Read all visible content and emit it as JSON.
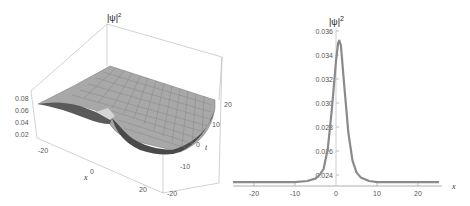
{
  "chart_data": [
    {
      "type": "surface3d",
      "title": "",
      "zlabel": "|ψ|²",
      "xlabel": "x",
      "ylabel": "t",
      "x_ticks": [
        "-20",
        "0",
        "20"
      ],
      "t_ticks": [
        "20",
        "10",
        "0",
        "-10",
        "-20"
      ],
      "z_ticks": [
        "0.08",
        "0.06",
        "0.04",
        "0.02"
      ],
      "x_range": [
        -25,
        25
      ],
      "t_range": [
        -20,
        20
      ],
      "z_range": [
        0.02,
        0.08
      ],
      "description": "Gray meshed surface of |ψ|² over (x,t): flat plateau rising toward box edges with a localized trough/dip near x≈0, t≈0"
    },
    {
      "type": "line",
      "title": "",
      "xlabel": "x",
      "ylabel": "|ψ|²",
      "x_ticks": [
        "-20",
        "-10",
        "0",
        "10",
        "20"
      ],
      "y_ticks": [
        "0.024",
        "0.026",
        "0.028",
        "0.030",
        "0.032",
        "0.034",
        "0.036"
      ],
      "xlim": [
        -25,
        25
      ],
      "ylim": [
        0.0232,
        0.036
      ],
      "grid": false,
      "series": [
        {
          "name": "|ψ|²",
          "color": "#8a8a8a",
          "x": [
            -25,
            -20,
            -15,
            -10,
            -7,
            -5,
            -4,
            -3,
            -2,
            -1,
            0,
            0.5,
            0.8,
            1.2,
            2,
            3,
            4,
            5,
            6,
            8,
            10,
            15,
            20,
            25
          ],
          "y": [
            0.0234,
            0.0234,
            0.0234,
            0.0234,
            0.0235,
            0.0237,
            0.024,
            0.0245,
            0.0262,
            0.0295,
            0.0335,
            0.035,
            0.0352,
            0.0348,
            0.0315,
            0.0275,
            0.0252,
            0.0242,
            0.0238,
            0.0235,
            0.0234,
            0.0234,
            0.0234,
            0.0234
          ]
        }
      ]
    }
  ],
  "labels": {
    "surface_z": "|ψ|",
    "surface_z_sup": "2",
    "surface_x": "x",
    "surface_t": "t",
    "line_y": "|ψ|",
    "line_y_sup": "2",
    "line_x": "x"
  }
}
